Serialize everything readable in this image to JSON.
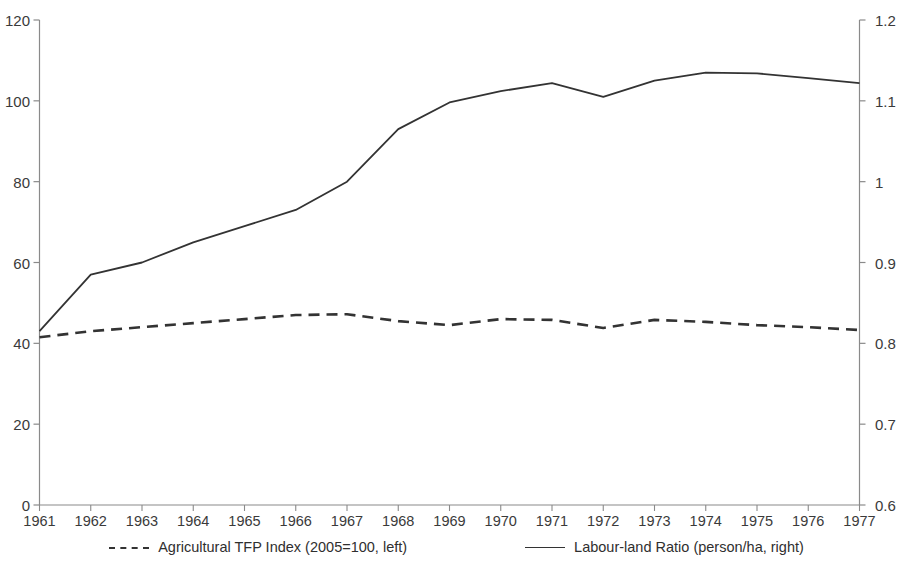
{
  "chart_data": {
    "type": "line",
    "title": "",
    "xlabel": "",
    "grid": false,
    "legend_position": "bottom",
    "x": [
      1961,
      1962,
      1963,
      1964,
      1965,
      1966,
      1967,
      1968,
      1969,
      1970,
      1971,
      1972,
      1973,
      1974,
      1975,
      1976,
      1977
    ],
    "xticklabels": [
      "1961",
      "1962",
      "1963",
      "1964",
      "1965",
      "1966",
      "1967",
      "1968",
      "1969",
      "1970",
      "1971",
      "1972",
      "1973",
      "1974",
      "1975",
      "1976",
      "1977"
    ],
    "left_axis": {
      "label": "",
      "ylim": [
        0,
        120
      ],
      "ticks": [
        0,
        20,
        40,
        60,
        80,
        100,
        120
      ],
      "ticklabels": [
        "0",
        "20",
        "40",
        "60",
        "80",
        "100",
        "120"
      ]
    },
    "right_axis": {
      "label": "",
      "ylim": [
        0.6,
        1.2
      ],
      "ticks": [
        0.6,
        0.7,
        0.8,
        0.9,
        1.0,
        1.1,
        1.2
      ],
      "ticklabels": [
        "0.6",
        "0.7",
        "0.8",
        "0.9",
        "1",
        "1.1",
        "1.2"
      ]
    },
    "series": [
      {
        "name": "Agricultural TFP Index (2005=100, left)",
        "axis": "left",
        "style": "dashed",
        "color": "#333333",
        "values": [
          41.5,
          43.0,
          44.0,
          45.0,
          46.0,
          47.0,
          47.2,
          45.5,
          44.5,
          46.0,
          45.8,
          43.8,
          45.8,
          45.3,
          44.5,
          44.0,
          43.3
        ]
      },
      {
        "name": "Labour-land Ratio (person/ha, right)",
        "axis": "right",
        "style": "solid",
        "color": "#333333",
        "values": [
          0.815,
          0.885,
          0.9,
          0.925,
          0.945,
          0.965,
          1.0,
          1.065,
          1.098,
          1.112,
          1.122,
          1.105,
          1.125,
          1.135,
          1.134,
          1.128,
          1.122
        ]
      }
    ]
  },
  "legend": {
    "items": [
      {
        "label": "Agricultural TFP Index (2005=100, left)",
        "style": "dashed"
      },
      {
        "label": "Labour-land Ratio (person/ha, right)",
        "style": "solid"
      }
    ]
  }
}
